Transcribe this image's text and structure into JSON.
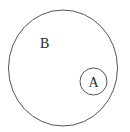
{
  "diagram": {
    "type": "set-containment",
    "outer_set": {
      "label": "B",
      "stroke": "#555555"
    },
    "inner_set": {
      "label": "A",
      "stroke": "#555555"
    },
    "relation": "A is a subset of B"
  }
}
